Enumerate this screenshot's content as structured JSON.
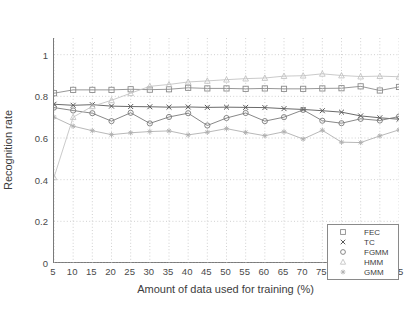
{
  "chart_data": {
    "type": "line",
    "title": "",
    "xlabel": "Amount of data used for training (%)",
    "ylabel": "Recognition rate",
    "x": [
      5,
      10,
      15,
      20,
      25,
      30,
      35,
      40,
      45,
      50,
      55,
      60,
      65,
      70,
      75,
      80,
      85,
      90,
      95
    ],
    "xlim": [
      5,
      95
    ],
    "ylim": [
      0,
      1.08
    ],
    "xticks": [
      "5",
      "10",
      "15",
      "20",
      "25",
      "30",
      "35",
      "40",
      "45",
      "50",
      "55",
      "60",
      "65",
      "70",
      "75",
      "80",
      "85",
      "90",
      "95"
    ],
    "yticks": [
      "0",
      "0.2",
      "0.4",
      "0.6",
      "0.8",
      "1"
    ],
    "ytick_values": [
      0,
      0.2,
      0.4,
      0.6,
      0.8,
      1
    ],
    "grid": "dotted both axes",
    "legend_position": "lower right",
    "series": [
      {
        "name": "FEC",
        "marker": "square",
        "color": "#8c8c8c",
        "values": [
          0.815,
          0.831,
          0.831,
          0.831,
          0.834,
          0.832,
          0.834,
          0.841,
          0.838,
          0.838,
          0.836,
          0.838,
          0.836,
          0.836,
          0.838,
          0.839,
          0.848,
          0.828,
          0.845
        ]
      },
      {
        "name": "TC",
        "marker": "x",
        "color": "#595959",
        "values": [
          0.762,
          0.757,
          0.76,
          0.753,
          0.751,
          0.75,
          0.748,
          0.749,
          0.747,
          0.748,
          0.747,
          0.746,
          0.741,
          0.737,
          0.731,
          0.724,
          0.706,
          0.697,
          0.69
        ]
      },
      {
        "name": "FGMM",
        "marker": "circle",
        "color": "#7a7a7a",
        "values": [
          0.746,
          0.732,
          0.719,
          0.681,
          0.721,
          0.67,
          0.701,
          0.719,
          0.66,
          0.696,
          0.72,
          0.681,
          0.7,
          0.735,
          0.683,
          0.671,
          0.692,
          0.684,
          0.703
        ]
      },
      {
        "name": "HMM",
        "marker": "triangle",
        "color": "#c4c4c4",
        "values": [
          0.411,
          0.7,
          0.752,
          0.781,
          0.815,
          0.848,
          0.857,
          0.869,
          0.874,
          0.88,
          0.885,
          0.888,
          0.897,
          0.899,
          0.908,
          0.9,
          0.895,
          0.897,
          0.894
        ]
      },
      {
        "name": "GMM",
        "marker": "star",
        "color": "#b0b0b0",
        "values": [
          0.7,
          0.657,
          0.635,
          0.616,
          0.625,
          0.631,
          0.634,
          0.615,
          0.628,
          0.645,
          0.627,
          0.611,
          0.63,
          0.595,
          0.637,
          0.58,
          0.578,
          0.61,
          0.639
        ]
      }
    ]
  },
  "legend": {
    "items": [
      {
        "label": "FEC",
        "marker": "square-marker-icon"
      },
      {
        "label": "TC",
        "marker": "x-marker-icon"
      },
      {
        "label": "FGMM",
        "marker": "circle-marker-icon"
      },
      {
        "label": "HMM",
        "marker": "triangle-marker-icon"
      },
      {
        "label": "GMM",
        "marker": "star-marker-icon"
      }
    ]
  }
}
